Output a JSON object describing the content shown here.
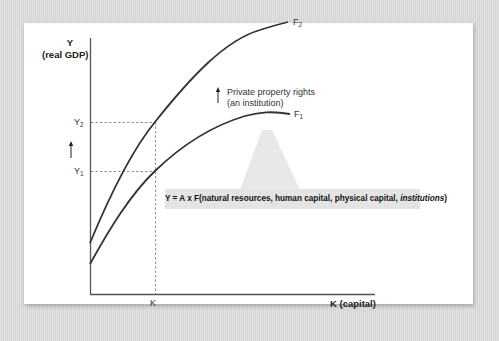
{
  "diagram": {
    "y_axis_label": "Y",
    "y_axis_sublabel": "(real GDP)",
    "x_axis_label": "K (capital)",
    "x_tick": "K",
    "y_ticks": [
      {
        "base": "Y",
        "sub": "2"
      },
      {
        "base": "Y",
        "sub": "1"
      }
    ],
    "curves": [
      {
        "base": "F",
        "sub": "2",
        "name": "F2 (with private property rights)"
      },
      {
        "base": "F",
        "sub": "1",
        "name": "F1"
      }
    ],
    "shift_note_line1": "Private property rights",
    "shift_note_line2": "(an institution)",
    "equation_main": "Y = A x F(natural resources, human capital, physical capital, ",
    "equation_italic": "institutions",
    "equation_close": ")",
    "colors": {
      "background": "#dcdcdc",
      "panel": "#ffffff",
      "curve": "#333333",
      "callout": "#e4e4e4",
      "callout_pointer": "#e8e8e8"
    }
  }
}
